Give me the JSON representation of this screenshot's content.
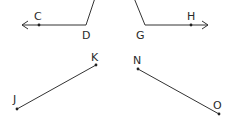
{
  "diagram": {
    "type": "geometry-figures",
    "figures": [
      {
        "name": "angle-CDx",
        "description": "Ray from D through C (arrow pointing left) and segment from D going up-right off the top",
        "points": [
          {
            "label": "C",
            "x": 39,
            "y": 25
          },
          {
            "label": "D",
            "x": 86,
            "y": 25
          }
        ],
        "arrow_tip": {
          "x": 21,
          "y": 25
        },
        "upper_end": {
          "x": 95,
          "y": -2
        }
      },
      {
        "name": "angle-GHx",
        "description": "Ray from G through H (arrow pointing right) and segment from G going up-left off the top",
        "points": [
          {
            "label": "G",
            "x": 145,
            "y": 25
          },
          {
            "label": "H",
            "x": 191,
            "y": 25
          }
        ],
        "arrow_tip": {
          "x": 209,
          "y": 25
        },
        "upper_end": {
          "x": 134,
          "y": -2
        }
      },
      {
        "name": "segment-JK",
        "points": [
          {
            "label": "J",
            "x": 17,
            "y": 109
          },
          {
            "label": "K",
            "x": 96,
            "y": 65
          }
        ]
      },
      {
        "name": "segment-NO",
        "points": [
          {
            "label": "N",
            "x": 138,
            "y": 69
          },
          {
            "label": "O",
            "x": 219,
            "y": 114
          }
        ]
      }
    ],
    "labels": {
      "C": "C",
      "D": "D",
      "G": "G",
      "H": "H",
      "J": "J",
      "K": "K",
      "N": "N",
      "O": "O"
    },
    "colors": {
      "line": "#333333",
      "text": "#2a2a2a",
      "background": "#ffffff"
    }
  }
}
